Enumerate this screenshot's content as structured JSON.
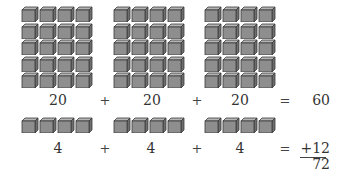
{
  "diagram": {
    "row1": {
      "groups": [
        {
          "cols": 4,
          "rows": 5,
          "count": 20
        },
        {
          "cols": 4,
          "rows": 5,
          "count": 20
        },
        {
          "cols": 4,
          "rows": 5,
          "count": 20
        }
      ],
      "labels": [
        "20",
        "20",
        "20"
      ],
      "operators": [
        "+",
        "+",
        "="
      ],
      "result": "60"
    },
    "row2": {
      "groups": [
        {
          "cols": 4,
          "rows": 1,
          "count": 4
        },
        {
          "cols": 4,
          "rows": 1,
          "count": 4
        },
        {
          "cols": 4,
          "rows": 1,
          "count": 4
        }
      ],
      "labels": [
        "4",
        "4",
        "4"
      ],
      "operators": [
        "+",
        "+",
        "="
      ],
      "result": "+12"
    },
    "total": "72",
    "colors": {
      "cube_front": "#8e8e8e",
      "cube_top": "#b5b5b5",
      "cube_side": "#6e6e6e",
      "cube_outline": "#3a3a3a"
    }
  }
}
